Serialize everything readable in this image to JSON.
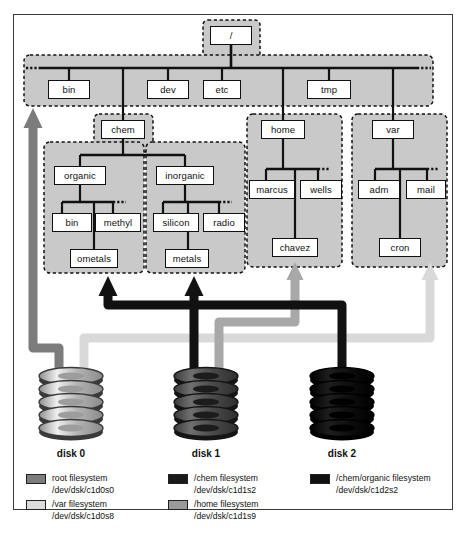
{
  "diagram": {
    "colors": {
      "region_fill": "#c9c9c9",
      "region_border": "#111111",
      "node_fill": "#ffffff",
      "node_border": "#111111",
      "root_arrow": "#7c7c7c",
      "var_arrow": "#d9d9d9",
      "chem_arrow": "#111111",
      "home_arrow": "#a8a8a8",
      "organic_arrow": "#111111",
      "page_border": "#3a3a3a"
    },
    "nodes": [
      {
        "id": "root",
        "label": "/",
        "x": 210,
        "y": 26,
        "w": 42,
        "h": 19
      },
      {
        "id": "bin",
        "label": "bin",
        "x": 48,
        "y": 80,
        "w": 42,
        "h": 19
      },
      {
        "id": "dev",
        "label": "dev",
        "x": 147,
        "y": 80,
        "w": 42,
        "h": 19
      },
      {
        "id": "etc",
        "label": "etc",
        "x": 203,
        "y": 80,
        "w": 38,
        "h": 19
      },
      {
        "id": "tmp",
        "label": "tmp",
        "x": 307,
        "y": 80,
        "w": 44,
        "h": 19
      },
      {
        "id": "chem",
        "label": "chem",
        "x": 101,
        "y": 120,
        "w": 44,
        "h": 19
      },
      {
        "id": "home",
        "label": "home",
        "x": 261,
        "y": 120,
        "w": 44,
        "h": 19
      },
      {
        "id": "var",
        "label": "var",
        "x": 372,
        "y": 120,
        "w": 42,
        "h": 19
      },
      {
        "id": "organic",
        "label": "organic",
        "x": 54,
        "y": 166,
        "w": 52,
        "h": 19
      },
      {
        "id": "inorganic",
        "label": "inorganic",
        "x": 156,
        "y": 166,
        "w": 58,
        "h": 19
      },
      {
        "id": "marcus",
        "label": "marcus",
        "x": 249,
        "y": 180,
        "w": 46,
        "h": 19
      },
      {
        "id": "wells",
        "label": "wells",
        "x": 300,
        "y": 180,
        "w": 42,
        "h": 19
      },
      {
        "id": "adm",
        "label": "adm",
        "x": 358,
        "y": 180,
        "w": 42,
        "h": 19
      },
      {
        "id": "mail",
        "label": "mail",
        "x": 406,
        "y": 180,
        "w": 40,
        "h": 19
      },
      {
        "id": "obin",
        "label": "bin",
        "x": 52,
        "y": 213,
        "w": 40,
        "h": 19
      },
      {
        "id": "methyl",
        "label": "methyl",
        "x": 95,
        "y": 213,
        "w": 46,
        "h": 19
      },
      {
        "id": "silicon",
        "label": "silicon",
        "x": 153,
        "y": 213,
        "w": 46,
        "h": 19
      },
      {
        "id": "radio",
        "label": "radio",
        "x": 203,
        "y": 213,
        "w": 42,
        "h": 19
      },
      {
        "id": "chavez",
        "label": "chavez",
        "x": 272,
        "y": 238,
        "w": 46,
        "h": 19
      },
      {
        "id": "cron",
        "label": "cron",
        "x": 379,
        "y": 238,
        "w": 42,
        "h": 19
      },
      {
        "id": "ometals",
        "label": "ometals",
        "x": 70,
        "y": 249,
        "w": 48,
        "h": 19
      },
      {
        "id": "metals",
        "label": "metals",
        "x": 165,
        "y": 249,
        "w": 44,
        "h": 19
      }
    ],
    "disks": [
      {
        "id": "disk0",
        "label": "disk 0",
        "cx": 71,
        "cy": 404,
        "tone": "light"
      },
      {
        "id": "disk1",
        "label": "disk 1",
        "cx": 206,
        "cy": 404,
        "tone": "medium"
      },
      {
        "id": "disk2",
        "label": "disk 2",
        "cx": 342,
        "cy": 404,
        "tone": "dark"
      }
    ],
    "legend": [
      {
        "id": "root-fs",
        "swatch": "#7c7c7c",
        "name": "root filesystem",
        "device": "/dev/dsk/c1d0s0",
        "x": 26,
        "y": 473
      },
      {
        "id": "var-fs",
        "swatch": "#dcdcdc",
        "name": "/var filesystem",
        "device": "/dev/dsk/c1d0s8",
        "x": 26,
        "y": 499
      },
      {
        "id": "chem-fs",
        "swatch": "#1a1a1a",
        "name": "/chem filesystem",
        "device": "/dev/dsk/c1d1s2",
        "x": 168,
        "y": 473
      },
      {
        "id": "home-fs",
        "swatch": "#9a9a9a",
        "name": "/home filesystem",
        "device": "/dev/dsk/c1d1s9",
        "x": 168,
        "y": 499
      },
      {
        "id": "organic-fs",
        "swatch": "#111111",
        "name": "/chem/organic filesystem",
        "device": "/dev/dsk/c1d2s2",
        "x": 310,
        "y": 473
      }
    ]
  }
}
